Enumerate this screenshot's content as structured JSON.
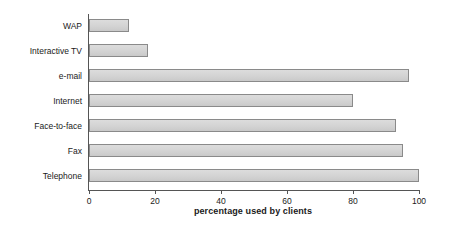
{
  "chart_data": {
    "type": "bar",
    "orientation": "horizontal",
    "title": "",
    "xlabel": "percentage used by clients",
    "ylabel": "Channel",
    "categories": [
      "WAP",
      "Interactive TV",
      "e-mail",
      "Internet",
      "Face-to-face",
      "Fax",
      "Telephone"
    ],
    "values": [
      12,
      18,
      97,
      80,
      93,
      95,
      100
    ],
    "xlim": [
      0,
      100
    ],
    "xticks": [
      0,
      20,
      40,
      60,
      80,
      100
    ],
    "xtick_labels": [
      "0",
      "20",
      "40",
      "60",
      "80",
      "100"
    ],
    "grid": false,
    "legend": null,
    "bar_fill_color": "#d2d2d2",
    "bar_border_color": "#8a8a8a",
    "axis_color": "#555555"
  }
}
